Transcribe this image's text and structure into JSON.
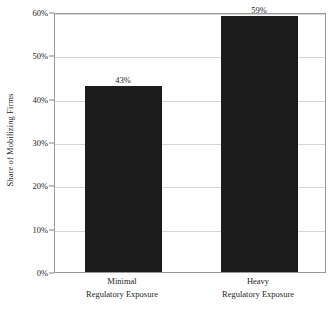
{
  "chart_data": {
    "type": "bar",
    "title": "",
    "subtitle": "",
    "xlabel": "",
    "ylabel": "Share of Mobilizing Firms",
    "categories": [
      "Minimal Regulatory Exposure",
      "Heavy Regulatory Exposure"
    ],
    "category_lines": [
      {
        "line1": "Minimal",
        "line2": "Regulatory Exposure"
      },
      {
        "line1": "Heavy",
        "line2": "Regulatory Exposure"
      }
    ],
    "values": [
      43,
      59
    ],
    "value_labels": [
      "43%",
      "59%"
    ],
    "ylim": [
      0,
      60
    ],
    "ytick_values": [
      0,
      10,
      20,
      30,
      40,
      50,
      60
    ],
    "ytick_labels": [
      "0%",
      "10%",
      "20%",
      "30%",
      "40%",
      "50%",
      "60%"
    ],
    "grid": true,
    "grid_axis": "y",
    "legend": false,
    "legend_position": "none",
    "bar_color": "#1c1c1c",
    "grid_color": "#d5d5d5",
    "frame_color": "#9a9a9a",
    "text_color": "#1f1f1f",
    "background_color": "#ffffff"
  }
}
